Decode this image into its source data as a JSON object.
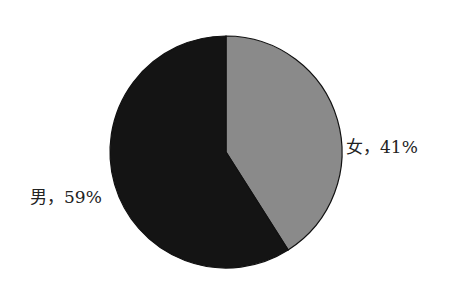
{
  "chart_data": {
    "type": "pie",
    "title": "",
    "categories": [
      "女",
      "男"
    ],
    "values": [
      41,
      59
    ],
    "labels": [
      "女，41%",
      "男，59%"
    ],
    "colors": [
      "#8a8a8a",
      "#141414"
    ],
    "start_angle": "12 o'clock, clockwise",
    "legend": "none (data labels outside slices)"
  },
  "labels": {
    "female": "女，41%",
    "male": "男，59%"
  }
}
